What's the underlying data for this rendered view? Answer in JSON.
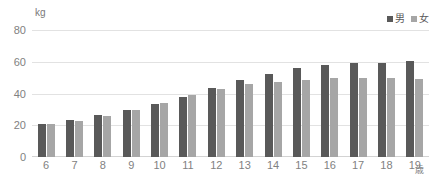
{
  "chart_data": {
    "type": "bar",
    "title": "",
    "subtitle": "",
    "xlabel": "歳",
    "ylabel": "kg",
    "unit_label": "kg",
    "x_unit_label": "歳",
    "categories": [
      "6",
      "7",
      "8",
      "9",
      "10",
      "11",
      "12",
      "13",
      "14",
      "15",
      "16",
      "17",
      "18",
      "19"
    ],
    "series": [
      {
        "name": "男",
        "color": "#595959",
        "values": [
          21.0,
          23.5,
          26.5,
          29.5,
          33.5,
          38.0,
          43.5,
          48.5,
          52.5,
          56.0,
          58.0,
          59.5,
          59.5,
          60.5
        ]
      },
      {
        "name": "女",
        "color": "#a6a6a6",
        "values": [
          20.5,
          23.0,
          26.0,
          29.5,
          34.0,
          39.0,
          43.0,
          46.0,
          47.5,
          48.5,
          49.5,
          50.0,
          49.5,
          49.0
        ]
      }
    ],
    "ylim": [
      0,
      80
    ],
    "yticks": [
      0,
      20,
      40,
      60,
      80
    ],
    "grid": true,
    "grid_color": "#e2e2e2",
    "legend": {
      "position": "top-right",
      "entries": [
        {
          "label": "男",
          "color": "#595959"
        },
        {
          "label": "女",
          "color": "#a6a6a6"
        }
      ]
    },
    "background": "#ffffff",
    "axis_text_color": "#818181"
  }
}
